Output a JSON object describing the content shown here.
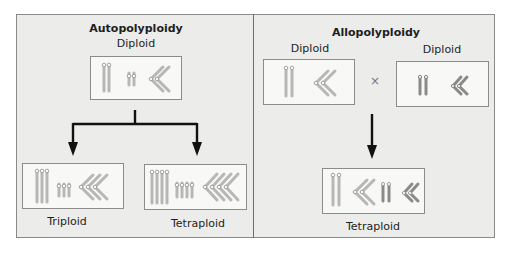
{
  "colors": {
    "panel_bg": "#ececea",
    "box_bg": "#f8f8f6",
    "chromosome_light": "#b7b7b5",
    "chromosome_dark": "#8a8a88",
    "arrow": "#111111"
  },
  "autopolyploidy": {
    "title": "Autopolyploidy",
    "parent": {
      "label": "Diploid",
      "sets": 2
    },
    "offspring": [
      {
        "label": "Triploid",
        "sets": 3
      },
      {
        "label": "Tetraploid",
        "sets": 4
      }
    ]
  },
  "allopolyploidy": {
    "title": "Allopolyploidy",
    "parents": [
      {
        "label": "Diploid",
        "species": "light"
      },
      {
        "label": "Diploid",
        "species": "dark"
      }
    ],
    "cross_symbol": "×",
    "offspring": {
      "label": "Tetraploid"
    }
  }
}
